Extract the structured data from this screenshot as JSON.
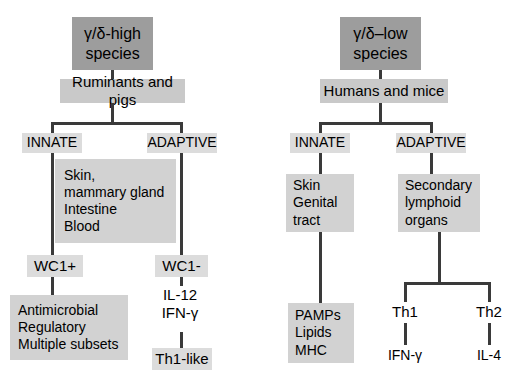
{
  "figure": {
    "type": "flow-diagram",
    "colors": {
      "title_box": "#9d9d9d",
      "mid_box": "#c9c9c9",
      "light_box": "#d2d2d2",
      "pale_box": "#dcdcdc",
      "line": "#3a3a3a",
      "text": "#000000",
      "background": "#ffffff"
    }
  },
  "left_panel": {
    "title": "γ/δ-high\nspecies",
    "species": "Ruminants and pigs",
    "branches": {
      "innate_label": "INNATE",
      "adaptive_label": "ADAPTIVE"
    },
    "tissue_box": "Skin,\nmammary gland\nIntestine\nBlood",
    "innate_marker": "WC1+",
    "adaptive_marker": "WC1-",
    "innate_functions": "Antimicrobial\nRegulatory\nMultiple subsets",
    "adaptive_cytokines": "IL-12\nIFN-γ",
    "adaptive_outcome": "Th1-like"
  },
  "right_panel": {
    "title": "γ/δ–low\nspecies",
    "species": "Humans and mice",
    "branches": {
      "innate_label": "INNATE",
      "adaptive_label": "ADAPTIVE"
    },
    "innate_tissue": "Skin\nGenital\n tract",
    "adaptive_tissue": "Secondary\nlymphoid\norgans",
    "innate_ligands": "PAMPs\nLipids\nMHC",
    "th1_label": "Th1",
    "th2_label": "Th2",
    "th1_cytokine": "IFN-γ",
    "th2_cytokine": "IL-4"
  }
}
